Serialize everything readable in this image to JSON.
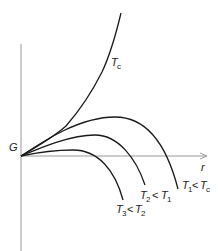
{
  "diagram": {
    "y_axis_label": "G",
    "x_axis_label": "r",
    "colors": {
      "curve": "#1a1a1a",
      "axis": "#9a9a9a",
      "background": "#ffffff"
    },
    "curves": [
      {
        "id": "Tc",
        "label": {
          "t": "T",
          "sub": "c"
        }
      },
      {
        "id": "T1",
        "label": {
          "t": "T",
          "sub": "1",
          "op": "<",
          "t2": "T",
          "sub2": "c"
        }
      },
      {
        "id": "T2",
        "label": {
          "t": "T",
          "sub": "2",
          "op": "<",
          "t2": "T",
          "sub2": "1"
        }
      },
      {
        "id": "T3",
        "label": {
          "t": "T",
          "sub": "3",
          "op": "<",
          "t2": "T",
          "sub2": "2"
        }
      }
    ]
  }
}
